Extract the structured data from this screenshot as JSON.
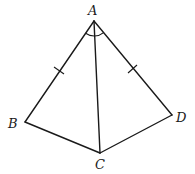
{
  "diagram": {
    "type": "geometry",
    "points": {
      "A": {
        "label": "A",
        "x": 94,
        "y": 21
      },
      "B": {
        "label": "B",
        "x": 25,
        "y": 122
      },
      "C": {
        "label": "C",
        "x": 100,
        "y": 153
      },
      "D": {
        "label": "D",
        "x": 172,
        "y": 115
      }
    },
    "segments": [
      "AB",
      "BC",
      "CD",
      "DA",
      "AC"
    ],
    "equal_sides": [
      "AB",
      "AD"
    ],
    "equal_angles": [
      "BAC",
      "CAD"
    ],
    "colors": {
      "stroke": "#1a1a1a",
      "background": "#ffffff"
    }
  }
}
